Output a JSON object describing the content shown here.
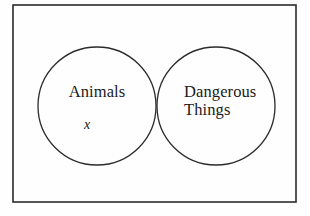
{
  "figure": {
    "type": "venn-diagram",
    "background_color": "#fefefe",
    "stroke_color": "#2b2b2b",
    "text_color": "#1a1a1a"
  },
  "universe_box": {
    "name": "universal-set-rectangle",
    "x": 13,
    "y": 5,
    "width": 283,
    "height": 197,
    "stroke_width": 1.6
  },
  "circles": [
    {
      "id": "left",
      "label": "Animals",
      "cx": 97,
      "cy": 106,
      "r": 59,
      "stroke_width": 1.3
    },
    {
      "id": "right",
      "label_line_1": "Dangerous",
      "label_line_2": "Things",
      "cx": 216,
      "cy": 106,
      "r": 59,
      "stroke_width": 1.3
    }
  ],
  "labels": {
    "left_set": "Animals",
    "right_set_line_1": "Dangerous",
    "right_set_line_2": "Things",
    "member_marker": "x"
  },
  "chart_data": {
    "type": "venn",
    "title": "",
    "sets": [
      {
        "name": "Animals",
        "position": "left"
      },
      {
        "name": "Dangerous Things",
        "position": "right"
      }
    ],
    "elements": [
      {
        "label": "x",
        "region": "Animals only",
        "in_sets": [
          "Animals"
        ],
        "not_in_sets": [
          "Dangerous Things"
        ],
        "x": 86,
        "y": 127
      }
    ],
    "regions": [
      {
        "name": "Animals only",
        "members": [
          "x"
        ]
      },
      {
        "name": "Animals ∩ Dangerous Things",
        "members": []
      },
      {
        "name": "Dangerous Things only",
        "members": []
      },
      {
        "name": "outside both",
        "members": []
      }
    ],
    "legend": "none",
    "grid": false
  }
}
